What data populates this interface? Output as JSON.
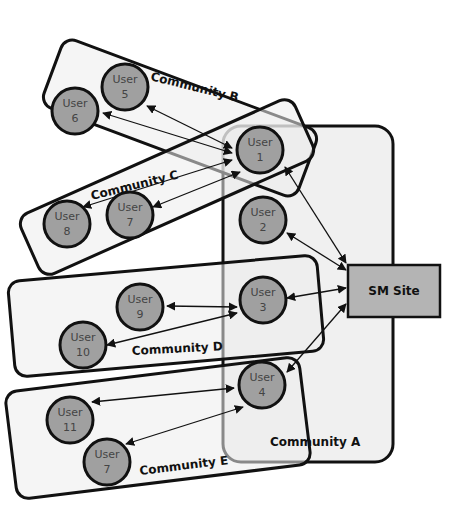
{
  "diagram": {
    "site": {
      "label": "SM Site"
    },
    "communities": {
      "a": "Community A",
      "b": "Community B",
      "c": "Community C",
      "d": "Community D",
      "e": "Community E"
    },
    "nodes": [
      {
        "id": "u1",
        "line1": "User",
        "line2": "1"
      },
      {
        "id": "u2",
        "line1": "User",
        "line2": "2"
      },
      {
        "id": "u3",
        "line1": "User",
        "line2": "3"
      },
      {
        "id": "u4",
        "line1": "User",
        "line2": "4"
      },
      {
        "id": "u5",
        "line1": "User",
        "line2": "5"
      },
      {
        "id": "u6",
        "line1": "User",
        "line2": "6"
      },
      {
        "id": "u7c",
        "line1": "User",
        "line2": "7"
      },
      {
        "id": "u8",
        "line1": "User",
        "line2": "8"
      },
      {
        "id": "u9",
        "line1": "User",
        "line2": "9"
      },
      {
        "id": "u10",
        "line1": "User",
        "line2": "10"
      },
      {
        "id": "u11",
        "line1": "User",
        "line2": "11"
      },
      {
        "id": "u7e",
        "line1": "User",
        "line2": "7"
      }
    ],
    "edges": [
      [
        "User 5",
        "User 1"
      ],
      [
        "User 6",
        "User 1"
      ],
      [
        "User 8",
        "User 1"
      ],
      [
        "User 7",
        "User 1"
      ],
      [
        "User 1",
        "SM Site"
      ],
      [
        "User 2",
        "SM Site"
      ],
      [
        "User 3",
        "SM Site"
      ],
      [
        "User 4",
        "SM Site"
      ],
      [
        "User 9",
        "User 3"
      ],
      [
        "User 10",
        "User 3"
      ],
      [
        "User 11",
        "User 4"
      ],
      [
        "User 7",
        "User 4"
      ]
    ]
  }
}
